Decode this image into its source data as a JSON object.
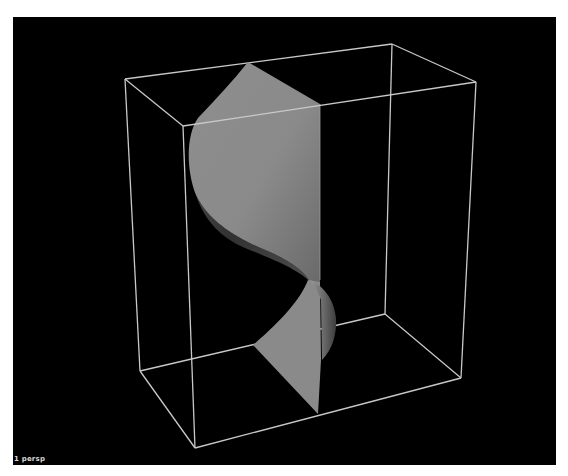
{
  "viewport": {
    "camera_label": "1 persp",
    "background_color": "#000000",
    "wireframe_color": "#c8c8c8",
    "surface_color": "#8c8c8c",
    "surface_shadow_color": "#4a4a4a"
  },
  "scene": {
    "objects": [
      {
        "name": "bounding-box",
        "type": "wireframe-cube"
      },
      {
        "name": "twisted-surface",
        "type": "nurbs-surface"
      }
    ]
  }
}
